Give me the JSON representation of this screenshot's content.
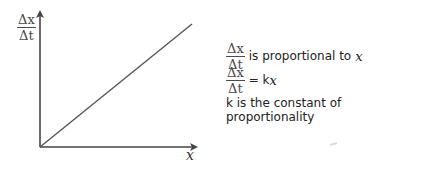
{
  "diagram": {
    "y_axis_label": {
      "numerator": "Δx",
      "denominator": "Δt"
    },
    "x_axis_label": "x",
    "line": {
      "from": [
        40,
        147
      ],
      "to": [
        192,
        24
      ],
      "description": "straight line through origin"
    },
    "colors": {
      "axis": "#444444",
      "line": "#555555",
      "text": "#222222"
    }
  },
  "notes": {
    "line1": {
      "frac_num": "Δx",
      "frac_den": "Δt",
      "text": "is proportional to",
      "var": "x"
    },
    "line2": {
      "frac_num": "Δx",
      "frac_den": "Δt",
      "text": "= k",
      "var": "x"
    },
    "line3": {
      "text": "k is the constant of proportionality"
    }
  }
}
